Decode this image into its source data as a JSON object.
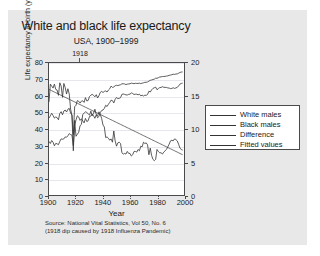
{
  "figure": {
    "title": "White and black life expectancy",
    "subtitle": "USA, 1900–1999",
    "annotation_1918": "1918",
    "source_line1": "Source: National Vital Statistics, Vol 50, No. 6",
    "source_line2": "(1918 dip caused by 1918 Influenza Pandemic)",
    "background": "#e8e8e8",
    "plot_background": "#ffffff",
    "line_color": "#333333"
  },
  "legend": {
    "position": "right",
    "items": [
      {
        "label": "White males"
      },
      {
        "label": "Black males"
      },
      {
        "label": "Difference"
      },
      {
        "label": "Fitted values"
      }
    ]
  },
  "chart_data": {
    "type": "line",
    "title": "White and black life expectancy",
    "subtitle": "USA, 1900–1999",
    "xlabel": "Year",
    "ylabel": "Life expectancy at birth (years)",
    "ylabel_right": "",
    "xlim": [
      1900,
      2000
    ],
    "ylim": [
      0,
      80
    ],
    "ylim_right": [
      0,
      20
    ],
    "grid": true,
    "xticks": [
      1900,
      1920,
      1940,
      1960,
      1980,
      2000
    ],
    "yticks": [
      0,
      10,
      20,
      30,
      40,
      50,
      60,
      70,
      80
    ],
    "yticks_right": [
      0,
      5,
      10,
      15,
      20
    ],
    "annotations": [
      {
        "text": "1918",
        "x": 1918,
        "note": "influenza pandemic dip"
      }
    ],
    "x": [
      1900,
      1901,
      1902,
      1903,
      1904,
      1905,
      1906,
      1907,
      1908,
      1909,
      1910,
      1911,
      1912,
      1913,
      1914,
      1915,
      1916,
      1917,
      1918,
      1919,
      1920,
      1921,
      1922,
      1923,
      1924,
      1925,
      1926,
      1927,
      1928,
      1929,
      1930,
      1931,
      1932,
      1933,
      1934,
      1935,
      1936,
      1937,
      1938,
      1939,
      1940,
      1941,
      1942,
      1943,
      1944,
      1945,
      1946,
      1947,
      1948,
      1949,
      1950,
      1951,
      1952,
      1953,
      1954,
      1955,
      1956,
      1957,
      1958,
      1959,
      1960,
      1961,
      1962,
      1963,
      1964,
      1965,
      1966,
      1967,
      1968,
      1969,
      1970,
      1971,
      1972,
      1973,
      1974,
      1975,
      1976,
      1977,
      1978,
      1979,
      1980,
      1981,
      1982,
      1983,
      1984,
      1985,
      1986,
      1987,
      1988,
      1989,
      1990,
      1991,
      1992,
      1993,
      1994,
      1995,
      1996,
      1997,
      1998,
      1999
    ],
    "series": [
      {
        "name": "White males",
        "axis": "left",
        "values": [
          46.6,
          48.0,
          49.5,
          48.2,
          46.6,
          47.3,
          46.9,
          45.6,
          49.5,
          50.5,
          48.6,
          50.9,
          51.5,
          50.3,
          52.0,
          52.5,
          49.6,
          48.4,
          36.6,
          53.5,
          54.4,
          57.2,
          56.8,
          55.7,
          56.9,
          57.1,
          56.1,
          59.0,
          57.0,
          57.3,
          59.7,
          60.5,
          61.0,
          60.4,
          59.5,
          60.8,
          58.8,
          60.2,
          62.2,
          62.8,
          62.1,
          62.8,
          63.1,
          62.4,
          63.6,
          64.4,
          66.0,
          65.2,
          65.5,
          66.2,
          66.5,
          66.3,
          66.6,
          66.8,
          67.4,
          67.4,
          67.3,
          66.9,
          67.2,
          67.3,
          67.4,
          67.8,
          67.6,
          67.5,
          67.7,
          67.6,
          67.6,
          67.8,
          67.5,
          67.8,
          68.0,
          68.3,
          68.3,
          68.5,
          69.0,
          69.5,
          69.7,
          70.0,
          70.2,
          70.8,
          70.7,
          71.1,
          71.5,
          71.6,
          71.8,
          71.8,
          71.9,
          72.1,
          72.2,
          72.5,
          72.7,
          72.9,
          73.2,
          73.1,
          73.3,
          73.4,
          73.8,
          74.3,
          74.5,
          74.6
        ]
      },
      {
        "name": "Black males",
        "axis": "left",
        "values": [
          32.5,
          31.2,
          33.0,
          32.0,
          29.8,
          31.3,
          31.0,
          30.5,
          32.5,
          34.0,
          33.8,
          34.0,
          35.2,
          35.0,
          35.9,
          37.2,
          36.6,
          36.3,
          29.9,
          42.2,
          45.5,
          48.0,
          47.3,
          45.2,
          46.2,
          44.9,
          43.7,
          46.4,
          44.5,
          45.0,
          47.6,
          47.8,
          49.0,
          48.0,
          46.5,
          48.6,
          46.8,
          47.6,
          50.0,
          51.2,
          51.5,
          52.5,
          54.4,
          53.6,
          55.0,
          56.1,
          57.5,
          57.2,
          55.8,
          58.0,
          59.1,
          58.4,
          58.6,
          59.0,
          61.0,
          61.2,
          61.0,
          60.7,
          60.6,
          61.0,
          61.1,
          61.9,
          61.5,
          60.9,
          61.1,
          61.1,
          60.7,
          61.1,
          60.1,
          60.5,
          60.0,
          60.5,
          60.4,
          60.9,
          62.9,
          62.4,
          63.7,
          64.6,
          65.0,
          65.4,
          63.8,
          64.5,
          65.1,
          65.2,
          65.6,
          65.3,
          65.2,
          65.2,
          64.9,
          64.8,
          64.5,
          64.6,
          65.0,
          64.6,
          64.9,
          65.2,
          66.1,
          67.2,
          67.6,
          67.8
        ]
      },
      {
        "name": "Difference",
        "axis": "right",
        "values": [
          14.1,
          16.8,
          16.5,
          16.2,
          16.8,
          16.0,
          15.9,
          15.1,
          17.0,
          16.5,
          14.8,
          16.9,
          16.3,
          15.3,
          16.1,
          15.3,
          13.0,
          12.1,
          6.7,
          11.3,
          8.9,
          9.2,
          9.5,
          10.5,
          10.7,
          12.2,
          12.4,
          12.6,
          12.5,
          12.3,
          12.1,
          12.7,
          12.0,
          12.4,
          13.0,
          12.2,
          12.0,
          12.6,
          12.2,
          11.6,
          10.6,
          10.3,
          8.7,
          8.8,
          8.6,
          8.3,
          8.5,
          8.0,
          9.7,
          8.2,
          7.4,
          7.9,
          8.0,
          7.8,
          6.4,
          6.2,
          6.3,
          6.2,
          6.6,
          6.3,
          6.3,
          5.9,
          6.1,
          6.6,
          6.6,
          6.5,
          6.9,
          6.7,
          7.4,
          7.3,
          8.0,
          7.8,
          7.9,
          7.6,
          6.1,
          7.1,
          6.0,
          5.4,
          5.2,
          5.4,
          6.9,
          6.6,
          6.4,
          6.4,
          6.2,
          6.5,
          6.7,
          6.9,
          7.3,
          7.7,
          8.2,
          8.3,
          8.2,
          8.5,
          8.4,
          8.2,
          7.7,
          7.1,
          6.9,
          6.8
        ]
      },
      {
        "name": "Fitted values",
        "axis": "right",
        "values": [
          16.0,
          15.9,
          15.8,
          15.7,
          15.6,
          15.5,
          15.4,
          15.3,
          15.2,
          15.1,
          15.0,
          14.9,
          14.8,
          14.7,
          14.6,
          14.5,
          14.4,
          14.3,
          14.2,
          14.1,
          14.0,
          13.9,
          13.8,
          13.7,
          13.6,
          13.5,
          13.4,
          13.3,
          13.2,
          13.1,
          13.0,
          12.9,
          12.8,
          12.7,
          12.6,
          12.5,
          12.4,
          12.3,
          12.2,
          12.1,
          12.0,
          11.9,
          11.8,
          11.7,
          11.6,
          11.5,
          11.4,
          11.3,
          11.2,
          11.1,
          11.0,
          10.9,
          10.8,
          10.7,
          10.6,
          10.5,
          10.4,
          10.3,
          10.2,
          10.1,
          10.0,
          9.9,
          9.8,
          9.7,
          9.6,
          9.5,
          9.4,
          9.3,
          9.2,
          9.1,
          9.0,
          8.9,
          8.8,
          8.7,
          8.6,
          8.5,
          8.4,
          8.3,
          8.2,
          8.1,
          8.0,
          7.9,
          7.8,
          7.7,
          7.6,
          7.5,
          7.4,
          7.3,
          7.2,
          7.1,
          7.0,
          6.9,
          6.8,
          6.7,
          6.6,
          6.5,
          6.4,
          6.3,
          6.2,
          6.1
        ]
      }
    ]
  }
}
